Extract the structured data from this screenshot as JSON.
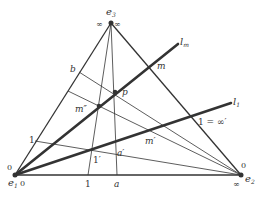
{
  "diagram": {
    "type": "projective-triangle-construction",
    "vertices": {
      "e1": {
        "label": "e",
        "sub": "1",
        "side_labels": [
          "0",
          "0"
        ]
      },
      "e2": {
        "label": "e",
        "sub": "2",
        "side_labels": [
          "0",
          "∞"
        ]
      },
      "e3": {
        "label": "e",
        "sub": "3",
        "side_labels": [
          "∞",
          "∞"
        ]
      }
    },
    "lines": {
      "l_m": {
        "label": "l",
        "sub": "m"
      },
      "l_1": {
        "label": "l",
        "sub": "1"
      }
    },
    "points": {
      "m": "m",
      "p": "p",
      "m_double_prime": "m″",
      "m_prime": "m′",
      "b": "b",
      "left_one": "1",
      "one_prime": "1′",
      "a_prime": "a′",
      "bottom_one": "1",
      "bottom_a": "a",
      "one_eq_inf_prime": "1 = ∞′"
    },
    "colors": {
      "stroke": "#333333",
      "background": "#ffffff"
    }
  }
}
